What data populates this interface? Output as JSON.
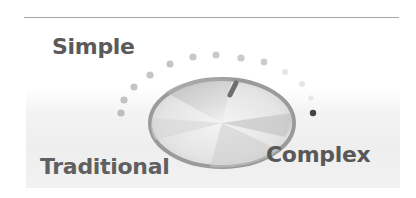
{
  "labels": {
    "simple": "Simple",
    "traditional": "Traditional",
    "complex": "Complex"
  },
  "dial": {
    "icon": "rotary-knob-icon",
    "indicator_position": "between Simple and Complex, slightly right of top",
    "colors": {
      "dot": "#bdbdbd",
      "dot_faint": "#e2e2e2",
      "dot_active": "#444444",
      "knob_rim": "#9a9a9a",
      "indicator": "#6e6e6e",
      "label_text": "#5a5a5a",
      "rule": "#a7a7a7"
    }
  }
}
